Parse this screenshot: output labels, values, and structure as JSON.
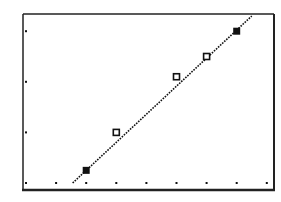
{
  "chart_data": {
    "type": "scatter",
    "title": "",
    "xlabel": "",
    "ylabel": "",
    "grid": false,
    "legend": null,
    "style": "graphing-calculator screen (monochrome)",
    "xlim": [
      0,
      8
    ],
    "ylim": [
      0,
      3.3
    ],
    "x_ticks": [
      0,
      1,
      2,
      3,
      4,
      5,
      6,
      7,
      8
    ],
    "y_ticks": [
      0,
      1,
      2,
      3
    ],
    "series": [
      {
        "name": "data points",
        "points": [
          {
            "x": 2.0,
            "y": 0.25,
            "marker": "filled-square"
          },
          {
            "x": 3.0,
            "y": 1.0,
            "marker": "open-square"
          },
          {
            "x": 5.0,
            "y": 2.1,
            "marker": "open-square"
          },
          {
            "x": 6.0,
            "y": 2.5,
            "marker": "open-square"
          },
          {
            "x": 7.0,
            "y": 3.0,
            "marker": "filled-square"
          }
        ]
      },
      {
        "name": "regression line",
        "type": "line",
        "style": "dotted",
        "from": {
          "x": 1.55,
          "y": 0.0
        },
        "to": {
          "x": 7.5,
          "y": 3.3
        }
      }
    ]
  },
  "colors": {
    "background": "#ffffff",
    "ink": "#111111",
    "frame": "#222222"
  }
}
